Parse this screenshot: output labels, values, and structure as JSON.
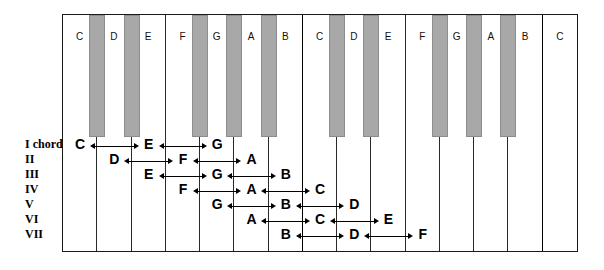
{
  "figure": {
    "type": "piano-keyboard-chord-diagram",
    "octaves": 2,
    "white_key_count": 15,
    "black_key_count": 10,
    "colors": {
      "black_key": "#a8a8a8",
      "white_key": "#ffffff",
      "outline": "#1a1a1a",
      "text": "#000000"
    }
  },
  "keyboard": {
    "white_keys": [
      {
        "label": "C",
        "octave_start": true
      },
      {
        "label": "D",
        "octave_start": false
      },
      {
        "label": "E",
        "octave_start": false
      },
      {
        "label": "F",
        "octave_start": false
      },
      {
        "label": "G",
        "octave_start": false
      },
      {
        "label": "A",
        "octave_start": false
      },
      {
        "label": "B",
        "octave_start": false
      },
      {
        "label": "C",
        "octave_start": true
      },
      {
        "label": "D",
        "octave_start": false
      },
      {
        "label": "E",
        "octave_start": false
      },
      {
        "label": "F",
        "octave_start": false
      },
      {
        "label": "G",
        "octave_start": false
      },
      {
        "label": "A",
        "octave_start": false
      },
      {
        "label": "B",
        "octave_start": false
      },
      {
        "label": "C",
        "octave_start": true
      }
    ],
    "black_keys": [
      {
        "name": "C#",
        "after_white_index": 0
      },
      {
        "name": "D#",
        "after_white_index": 1
      },
      {
        "name": "F#",
        "after_white_index": 3
      },
      {
        "name": "G#",
        "after_white_index": 4
      },
      {
        "name": "A#",
        "after_white_index": 5
      },
      {
        "name": "C#",
        "after_white_index": 7
      },
      {
        "name": "D#",
        "after_white_index": 8
      },
      {
        "name": "F#",
        "after_white_index": 10
      },
      {
        "name": "G#",
        "after_white_index": 11
      },
      {
        "name": "A#",
        "after_white_index": 12
      }
    ]
  },
  "chords": [
    {
      "numeral": "I chord",
      "notes": [
        {
          "label": "C",
          "white_index": 0
        },
        {
          "label": "E",
          "white_index": 2
        },
        {
          "label": "G",
          "white_index": 4
        }
      ]
    },
    {
      "numeral": "II",
      "notes": [
        {
          "label": "D",
          "white_index": 1
        },
        {
          "label": "F",
          "white_index": 3
        },
        {
          "label": "A",
          "white_index": 5
        }
      ]
    },
    {
      "numeral": "III",
      "notes": [
        {
          "label": "E",
          "white_index": 2
        },
        {
          "label": "G",
          "white_index": 4
        },
        {
          "label": "B",
          "white_index": 6
        }
      ]
    },
    {
      "numeral": "IV",
      "notes": [
        {
          "label": "F",
          "white_index": 3
        },
        {
          "label": "A",
          "white_index": 5
        },
        {
          "label": "C",
          "white_index": 7
        }
      ]
    },
    {
      "numeral": "V",
      "notes": [
        {
          "label": "G",
          "white_index": 4
        },
        {
          "label": "B",
          "white_index": 6
        },
        {
          "label": "D",
          "white_index": 8
        }
      ]
    },
    {
      "numeral": "VI",
      "notes": [
        {
          "label": "A",
          "white_index": 5
        },
        {
          "label": "C",
          "white_index": 7
        },
        {
          "label": "E",
          "white_index": 9
        }
      ]
    },
    {
      "numeral": "VII",
      "notes": [
        {
          "label": "B",
          "white_index": 6
        },
        {
          "label": "D",
          "white_index": 8
        },
        {
          "label": "F",
          "white_index": 10
        }
      ]
    }
  ]
}
